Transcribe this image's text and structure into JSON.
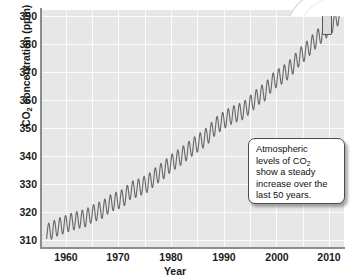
{
  "chart_data": {
    "type": "line",
    "title": "",
    "xlabel": "Year",
    "ylabel": "CO2 concentration (ppm)",
    "ylabel_parts": {
      "pre": "CO",
      "sub": "2",
      "post": " concentration (ppm)"
    },
    "xlim": [
      1957,
      2011
    ],
    "ylim": [
      310,
      392
    ],
    "xticks": [
      1960,
      1970,
      1980,
      1990,
      2000,
      2010
    ],
    "yticks": [
      310,
      320,
      330,
      340,
      350,
      360,
      370,
      380,
      390
    ],
    "grid": true,
    "legend": "none",
    "series": [
      {
        "name": "Atmospheric CO2 concentration (Mauna Loa)",
        "description": "Annual mean trend with seasonal sawtooth oscillation of about 6 ppm peak-to-peak",
        "seasonal_amplitude_ppm": 3.0,
        "x": [
          1958,
          1959,
          1960,
          1961,
          1962,
          1963,
          1964,
          1965,
          1966,
          1967,
          1968,
          1969,
          1970,
          1971,
          1972,
          1973,
          1974,
          1975,
          1976,
          1977,
          1978,
          1979,
          1980,
          1981,
          1982,
          1983,
          1984,
          1985,
          1986,
          1987,
          1988,
          1989,
          1990,
          1991,
          1992,
          1993,
          1994,
          1995,
          1996,
          1997,
          1998,
          1999,
          2000,
          2001,
          2002,
          2003,
          2004,
          2005,
          2006,
          2007,
          2008,
          2009,
          2010
        ],
        "values": [
          315.0,
          315.8,
          316.9,
          317.6,
          318.4,
          319.0,
          319.6,
          320.0,
          321.4,
          322.2,
          323.0,
          324.6,
          325.7,
          326.3,
          327.5,
          329.7,
          330.2,
          331.1,
          332.0,
          333.8,
          335.4,
          336.8,
          338.7,
          340.1,
          341.4,
          343.0,
          344.6,
          346.0,
          347.4,
          349.2,
          351.6,
          353.1,
          354.4,
          355.6,
          356.4,
          357.1,
          358.8,
          360.8,
          362.6,
          363.7,
          366.6,
          368.3,
          369.5,
          371.0,
          373.1,
          375.6,
          377.4,
          379.6,
          381.8,
          383.7,
          385.6,
          387.4,
          389.8
        ]
      }
    ],
    "annotations": [
      {
        "name": "trend-callout",
        "text": "Atmospheric levels of CO2 show a steady increase over the last 50 years.",
        "lines": [
          "Atmospheric",
          "levels of CO2",
          "show a steady",
          "increase over the",
          "last 50 years."
        ]
      }
    ],
    "colors": {
      "panel_background": "#e7e7e7",
      "gridline": "#fbfbfb",
      "axis": "#8d8d8d",
      "line": "#6a6a6a",
      "text": "#1a1a1a",
      "callout_background": "#ffffff",
      "callout_border": "#4b4b4b"
    }
  },
  "axis": {
    "y_title_pre": "CO",
    "y_title_sub": "2",
    "y_title_post": " concentration (ppm)",
    "x_title": "Year",
    "yticks": [
      "390",
      "380",
      "370",
      "360",
      "350",
      "340",
      "330",
      "320",
      "310"
    ],
    "xticks": [
      "1960",
      "1970",
      "1980",
      "1990",
      "2000",
      "2010"
    ]
  },
  "callout": {
    "line1": "Atmospheric",
    "line2_pre": "levels of CO",
    "line2_sub": "2",
    "line3": "show a steady",
    "line4": "increase over the",
    "line5": "last 50 years."
  }
}
